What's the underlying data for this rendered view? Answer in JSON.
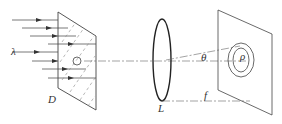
{
  "diagram": {
    "labels": {
      "wavelength": "λ",
      "plate": "D",
      "lens": "L",
      "angle": "θ",
      "radius": "ρ",
      "focal": "f"
    },
    "colors": {
      "stroke": "#444444",
      "background": "#ffffff"
    }
  }
}
